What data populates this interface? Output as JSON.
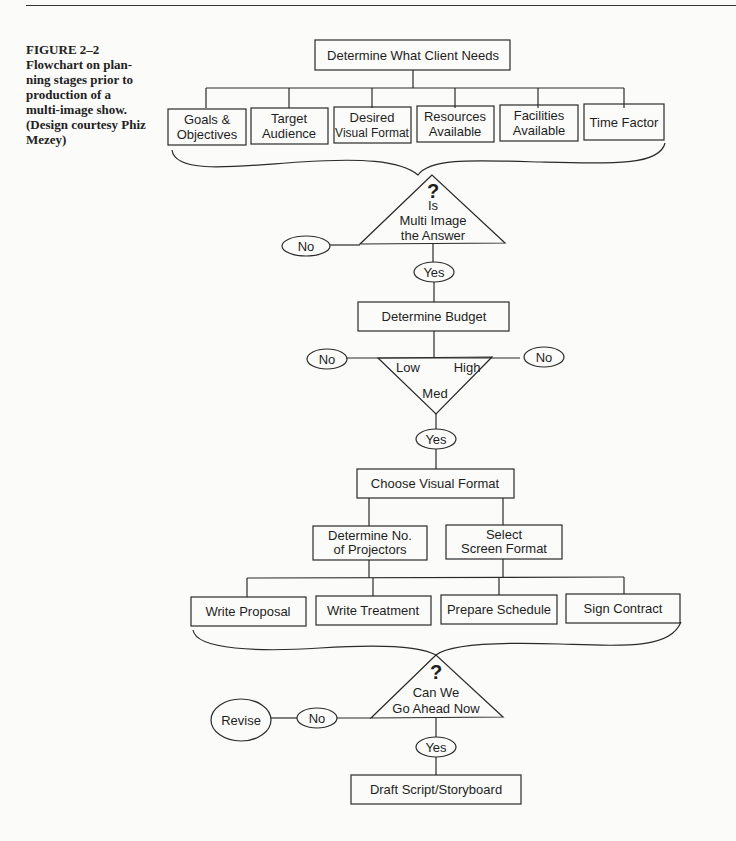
{
  "caption": {
    "lines": [
      "FIGURE 2–2",
      "Flowchart on plan-",
      "ning stages prior to",
      "production of a",
      "multi-image show.",
      "(Design courtesy Phiz",
      "Mezey)"
    ]
  },
  "flow": {
    "start": "Determine What Client Needs",
    "needs": [
      [
        "Goals &",
        "Objectives"
      ],
      [
        "Target",
        "Audience"
      ],
      [
        "Desired",
        "Visual Format"
      ],
      [
        "Resources",
        "Available"
      ],
      [
        "Facilities",
        "Available"
      ],
      [
        "Time Factor"
      ]
    ],
    "decision1": {
      "mark": "?",
      "lines": [
        "Is",
        "Multi Image",
        "the Answer"
      ],
      "no": "No",
      "yes": "Yes"
    },
    "budget": "Determine Budget",
    "budget_decision": {
      "low": "Low",
      "med": "Med",
      "high": "High",
      "no_left": "No",
      "no_right": "No",
      "yes": "Yes"
    },
    "choose": "Choose Visual Format",
    "sub": [
      [
        "Determine No.",
        "of Projectors"
      ],
      [
        "Select",
        "Screen Format"
      ]
    ],
    "tasks": [
      "Write Proposal",
      "Write Treatment",
      "Prepare Schedule",
      "Sign Contract"
    ],
    "decision2": {
      "mark": "?",
      "lines": [
        "Can We",
        "Go Ahead Now"
      ],
      "no": "No",
      "revise": "Revise",
      "yes": "Yes"
    },
    "final": "Draft Script/Storyboard"
  }
}
